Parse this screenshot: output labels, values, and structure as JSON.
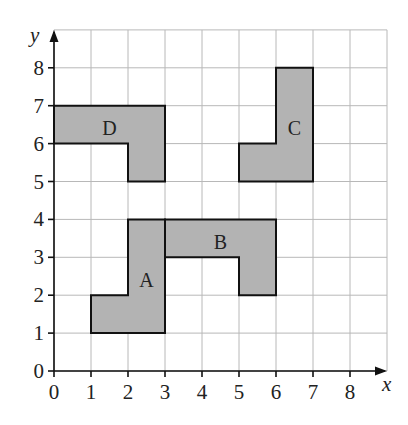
{
  "diagram": {
    "type": "coordinate-grid",
    "axes": {
      "x_label": "x",
      "y_label": "y",
      "x_ticks": [
        "0",
        "1",
        "2",
        "3",
        "4",
        "5",
        "6",
        "7",
        "8"
      ],
      "y_ticks": [
        "0",
        "1",
        "2",
        "3",
        "4",
        "5",
        "6",
        "7",
        "8"
      ],
      "grid_extent": {
        "x": [
          0,
          9
        ],
        "y": [
          0,
          9
        ]
      }
    },
    "colors": {
      "shape_fill": "#b3b3b3",
      "shape_stroke": "#111111",
      "grid": "#b8b8b8",
      "background": "#ffffff"
    },
    "shapes": [
      {
        "label": "A",
        "points": [
          [
            1,
            1
          ],
          [
            3,
            1
          ],
          [
            3,
            4
          ],
          [
            2,
            4
          ],
          [
            2,
            2
          ],
          [
            1,
            2
          ]
        ],
        "label_pos": [
          2.5,
          2.4
        ]
      },
      {
        "label": "B",
        "points": [
          [
            3,
            3
          ],
          [
            3,
            4
          ],
          [
            6,
            4
          ],
          [
            6,
            2
          ],
          [
            5,
            2
          ],
          [
            5,
            3
          ]
        ],
        "label_pos": [
          4.5,
          3.4
        ]
      },
      {
        "label": "C",
        "points": [
          [
            5,
            5
          ],
          [
            7,
            5
          ],
          [
            7,
            8
          ],
          [
            6,
            8
          ],
          [
            6,
            6
          ],
          [
            5,
            6
          ]
        ],
        "label_pos": [
          6.5,
          6.4
        ]
      },
      {
        "label": "D",
        "points": [
          [
            0,
            6
          ],
          [
            0,
            7
          ],
          [
            3,
            7
          ],
          [
            3,
            5
          ],
          [
            2,
            5
          ],
          [
            2,
            6
          ]
        ],
        "label_pos": [
          1.5,
          6.4
        ]
      }
    ]
  }
}
